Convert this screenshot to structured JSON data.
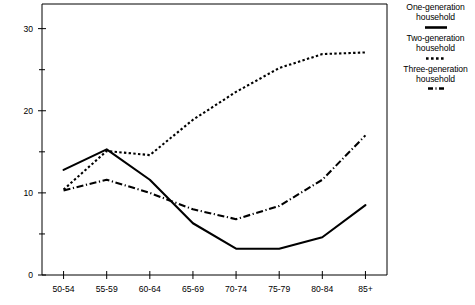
{
  "chart_data": {
    "type": "line",
    "title": "",
    "xlabel": "",
    "ylabel": "",
    "categories": [
      "50-54",
      "55-59",
      "60-64",
      "65-69",
      "70-74",
      "75-79",
      "80-84",
      "85+"
    ],
    "x_tick_labels": [
      "50-54",
      "55-59",
      "60-64",
      "65-69",
      "70-74",
      "75-79",
      "80-84",
      "85+"
    ],
    "y_tick_labels": [
      "0",
      "10",
      "20",
      "30"
    ],
    "y_major_ticks": [
      0,
      10,
      20,
      30
    ],
    "y_minor_ticks": [
      5,
      15,
      25
    ],
    "ylim": [
      0,
      33
    ],
    "grid": false,
    "legend_position": "right",
    "series": [
      {
        "name": "One-generation household",
        "style": "solid",
        "color": "#000000",
        "values": [
          12.8,
          15.3,
          11.6,
          6.3,
          3.2,
          3.2,
          4.6,
          8.5
        ]
      },
      {
        "name": "Two-generation household",
        "style": "dotted",
        "color": "#000000",
        "values": [
          10.4,
          15.1,
          14.6,
          18.9,
          22.3,
          25.2,
          26.9,
          27.1
        ]
      },
      {
        "name": "Three-generation household",
        "style": "dash-dot",
        "color": "#000000",
        "values": [
          10.3,
          11.6,
          10.0,
          8.0,
          6.8,
          8.4,
          11.6,
          17.0
        ]
      }
    ]
  },
  "legend": {
    "entries": [
      {
        "line1": "One-generation",
        "line2": "household",
        "sample": "solid-line-sample"
      },
      {
        "line1": "Two-generation",
        "line2": "household",
        "sample": "dotted-line-sample"
      },
      {
        "line1": "Three-generation",
        "line2": "household",
        "sample": "dash-dot-line-sample"
      }
    ]
  }
}
